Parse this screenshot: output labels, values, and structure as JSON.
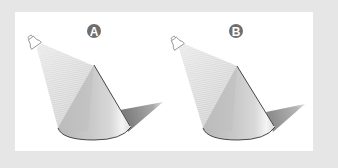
{
  "figure": {
    "panels": [
      {
        "id": "A",
        "label": "A",
        "elements": [
          "lamp",
          "light-beam",
          "cone",
          "cast-shadow"
        ]
      },
      {
        "id": "B",
        "label": "B",
        "elements": [
          "lamp",
          "light-beam",
          "cone",
          "cast-shadow"
        ]
      }
    ]
  },
  "colors": {
    "page_background": "#e6e6e6",
    "panel_background": "#ffffff",
    "badge_fill": "#6e6e6e",
    "badge_text": "#ffffff",
    "cone_light": "#f2f2f2",
    "cone_mid": "#c8c8c8",
    "cone_dark": "#9a9a9a",
    "outline": "#333333",
    "shadow": "#8c8c8c",
    "beam": "#c4c4c4"
  }
}
